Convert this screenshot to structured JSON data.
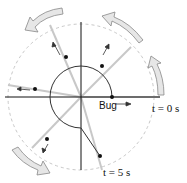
{
  "labels": {
    "bug": "Bug",
    "t0": "t = 0 s",
    "t5": "t = 5 s"
  },
  "colors": {
    "axis": "#111111",
    "circle": "#333333",
    "ray": "#c8c8c8",
    "dashed_circle": "#c8c8c8",
    "arrow_fill": "#e6e6e6",
    "arrow_stroke": "#888888"
  },
  "diagram": {
    "center": [
      81,
      97
    ],
    "inner_radius": 31,
    "outer_dashed_radius": 73,
    "positions_deg": [
      0,
      45,
      112,
      170,
      225,
      290
    ]
  }
}
